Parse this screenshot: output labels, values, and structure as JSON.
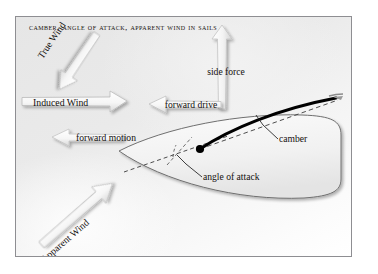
{
  "figure": {
    "title": "Camber, angle of attack, apparent wind in sails",
    "background_color": "#eaeaea",
    "border_color": "#8e8e92",
    "ink_color": "#14100e"
  },
  "labels": {
    "true_wind": "True Wind",
    "induced_wind": "Induced Wind",
    "apparent_wind": "Apparent Wind",
    "side_force": "side force",
    "forward_drive": "forward drive",
    "forward_motion": "forward motion",
    "camber": "camber",
    "angle_of_attack": "angle of attack"
  },
  "arrows": [
    {
      "name": "true-wind-arrow",
      "label": "True Wind",
      "direction": "down-left",
      "angle_deg": 124,
      "style": "3d-block-arrow",
      "fill": "#f5f5f5",
      "stroke": "#b8b8b8"
    },
    {
      "name": "induced-wind-arrow",
      "label": "Induced Wind",
      "direction": "right",
      "angle_deg": 0,
      "style": "3d-block-arrow",
      "fill": "#f7f7f7",
      "stroke": "#b8b8b8"
    },
    {
      "name": "apparent-wind-arrow",
      "label": "Apparent Wind",
      "direction": "up-right",
      "angle_deg": -41,
      "style": "3d-block-arrow",
      "fill": "#f7f7f7",
      "stroke": "#bcbcbc"
    },
    {
      "name": "side-force-arrow",
      "label": "side force",
      "direction": "up",
      "angle_deg": -90,
      "style": "3d-block-arrow",
      "fill": "#f2f2f2",
      "stroke": "#c2c2c2"
    },
    {
      "name": "forward-drive-arrow",
      "label": "forward drive",
      "direction": "left",
      "angle_deg": 180,
      "style": "3d-block-arrow",
      "fill": "#f4f4f4",
      "stroke": "#bfbfbf"
    },
    {
      "name": "forward-motion-arrow",
      "label": "forward motion",
      "direction": "left",
      "angle_deg": 180,
      "style": "3d-block-arrow",
      "fill": "#f6f6f6",
      "stroke": "#c4c4c4"
    }
  ],
  "diagram": {
    "hull": {
      "name": "boat-hull",
      "description": "plan view of hull, bow at left, rounded transom at right",
      "outline_color": "#6f6f6f",
      "fill": "#f3f3f3"
    },
    "sail": {
      "name": "sail-curve",
      "description": "thick cambered sail section from mast to leech",
      "color": "#000000",
      "thickness_px": 3
    },
    "chord_line": {
      "name": "sail-chord-line",
      "description": "dashed straight line from mast (luff) to leech",
      "style": "dashed",
      "color": "#3c3c3c"
    },
    "centerline": {
      "name": "hull-centerline",
      "description": "dashed boat centerline through mast toward bow",
      "style": "dashed",
      "color": "#3c3c3c"
    },
    "mast_point": {
      "name": "mast-point",
      "description": "filled black dot marking mast / luff",
      "color": "#000000"
    },
    "angle_arc": {
      "name": "angle-of-attack-arc",
      "description": "small arc between chord line and centerline"
    },
    "leaders": [
      {
        "name": "camber-leader-line",
        "target": "camber"
      },
      {
        "name": "angle-of-attack-leader-line",
        "target": "angle of attack"
      }
    ]
  }
}
